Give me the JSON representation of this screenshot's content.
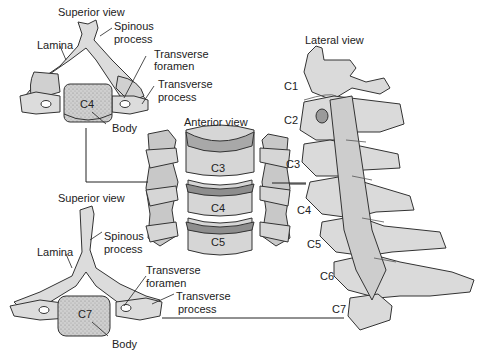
{
  "diagram": {
    "panels": {
      "c4_superior": {
        "view_label": "Superior view",
        "vertebra": "C4",
        "labels": {
          "spinous": [
            "Spinous",
            "process"
          ],
          "lamina": "Lamina",
          "transverse_foramen": [
            "Transverse",
            "foramen"
          ],
          "transverse_process": [
            "Transverse",
            "process"
          ],
          "body": "Body"
        }
      },
      "anterior": {
        "view_label": "Anterior view",
        "vertebrae": [
          "C3",
          "C4",
          "C5"
        ]
      },
      "lateral": {
        "view_label": "Lateral view",
        "vertebrae": [
          "C1",
          "C2",
          "C3",
          "C4",
          "C5",
          "C6",
          "C7"
        ]
      },
      "c7_superior": {
        "view_label": "Superior view",
        "vertebra": "C7",
        "labels": {
          "spinous": [
            "Spinous",
            "process"
          ],
          "lamina": "Lamina",
          "transverse_foramen": [
            "Transverse",
            "foramen"
          ],
          "transverse_process": [
            "Transverse",
            "process"
          ],
          "body": "Body"
        }
      }
    },
    "colors": {
      "bone": "#d9d9d9",
      "bone_dark": "#9a9a9a",
      "outline": "#333333",
      "text": "#222222"
    }
  }
}
